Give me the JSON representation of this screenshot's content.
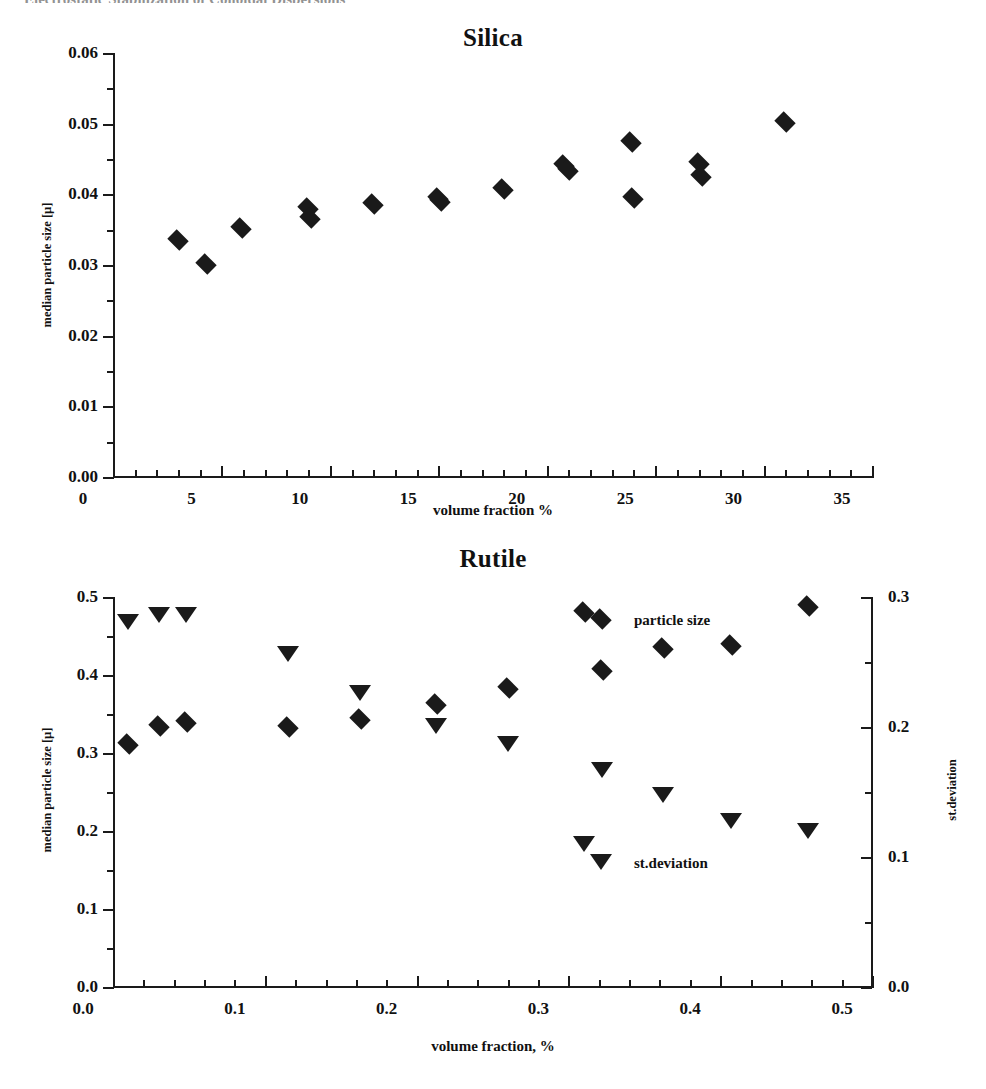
{
  "page": {
    "caption_clipped": "Electrostatic Stabilization of Colloidal Dispersions"
  },
  "charts": [
    {
      "id": "silica",
      "title": "Silica",
      "xlabel": "volume fraction %",
      "ylabel": "median particle size [µ]"
    },
    {
      "id": "rutile",
      "title": "Rutile",
      "xlabel": "volume fraction, %",
      "ylabel_left": "median particle size [µ]",
      "ylabel_right": "st.deviation",
      "legend": {
        "particle_size": "particle size",
        "st_deviation": "st.deviation"
      }
    }
  ],
  "chart_data": [
    {
      "type": "scatter",
      "title": "Silica",
      "xlabel": "volume fraction %",
      "ylabel": "median particle size [µ]",
      "xlim": [
        0,
        35
      ],
      "ylim": [
        0.0,
        0.06
      ],
      "xticks": [
        "0",
        "5",
        "10",
        "15",
        "20",
        "25",
        "30",
        "35"
      ],
      "xtick_values": [
        0,
        5,
        10,
        15,
        20,
        25,
        30,
        35
      ],
      "yticks": [
        "0.00",
        "0.01",
        "0.02",
        "0.03",
        "0.04",
        "0.05",
        "0.06"
      ],
      "ytick_values": [
        0.0,
        0.01,
        0.02,
        0.03,
        0.04,
        0.05,
        0.06
      ],
      "minor_ticks": true,
      "grid": false,
      "legend_position": "none",
      "series": [
        {
          "name": "median particle size",
          "marker": "diamond",
          "x": [
            3.0,
            4.3,
            5.9,
            9.0,
            9.1,
            12.0,
            15.0,
            15.1,
            18.0,
            20.8,
            21.0,
            23.9,
            24.0,
            27.0,
            27.1,
            31.0
          ],
          "y": [
            0.0335,
            0.0301,
            0.0352,
            0.038,
            0.0366,
            0.0386,
            0.0395,
            0.0391,
            0.0408,
            0.0441,
            0.0434,
            0.0474,
            0.0395,
            0.0444,
            0.0426,
            0.0503
          ]
        }
      ]
    },
    {
      "type": "scatter",
      "title": "Rutile",
      "xlabel": "volume fraction, %",
      "ylabel_left": "median particle size [µ]",
      "ylabel_right": "st.deviation",
      "xlim": [
        0.0,
        0.5
      ],
      "ylim_left": [
        0.0,
        0.5
      ],
      "ylim_right": [
        0.0,
        0.3
      ],
      "xticks": [
        "0.0",
        "0.1",
        "0.2",
        "0.3",
        "0.4",
        "0.5"
      ],
      "xtick_values": [
        0.0,
        0.1,
        0.2,
        0.3,
        0.4,
        0.5
      ],
      "yticks_left": [
        "0.0",
        "0.1",
        "0.2",
        "0.3",
        "0.4",
        "0.5"
      ],
      "ytick_values_left": [
        0.0,
        0.1,
        0.2,
        0.3,
        0.4,
        0.5
      ],
      "yticks_right": [
        "0.0",
        "0.1",
        "0.2",
        "0.3"
      ],
      "ytick_values_right": [
        0.0,
        0.1,
        0.2,
        0.3
      ],
      "minor_ticks": true,
      "grid": false,
      "legend_position": "inside",
      "series": [
        {
          "name": "particle size",
          "marker": "diamond",
          "axis": "left",
          "x": [
            0.01,
            0.03,
            0.048,
            0.115,
            0.163,
            0.213,
            0.26,
            0.31,
            0.322,
            0.362,
            0.407,
            0.458
          ],
          "y": [
            0.312,
            0.335,
            0.34,
            0.333,
            0.343,
            0.363,
            0.383,
            0.481,
            0.406,
            0.435,
            0.439,
            0.488
          ]
        },
        {
          "name": "st.deviation",
          "marker": "triangle",
          "axis": "right",
          "x": [
            0.01,
            0.03,
            0.048,
            0.115,
            0.163,
            0.213,
            0.26,
            0.31,
            0.322,
            0.362,
            0.407,
            0.458
          ],
          "y": [
            0.281,
            0.286,
            0.286,
            0.256,
            0.226,
            0.201,
            0.187,
            0.11,
            0.167,
            0.148,
            0.128,
            0.12
          ]
        }
      ]
    }
  ]
}
